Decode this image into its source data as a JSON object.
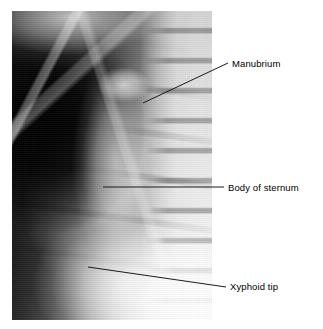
{
  "figure": {
    "type": "annotated-radiograph",
    "modality": "X-ray",
    "view": "lateral sternum",
    "background_color": "#ffffff",
    "line_color": "#1a1a1a",
    "text_color": "#000000"
  },
  "image": {
    "alt_name": "lateral-chest-xray-sternum",
    "left": 12,
    "top": 11,
    "width": 200,
    "height": 309
  },
  "annotations": [
    {
      "id": "manubrium",
      "label": "Manubrium",
      "leader": {
        "x1": 143,
        "y1": 103,
        "x2": 228,
        "y2": 63
      },
      "label_x": 232,
      "label_y": 58
    },
    {
      "id": "body-of-sternum",
      "label": "Body of sternum",
      "leader": {
        "x1": 103,
        "y1": 187,
        "x2": 224,
        "y2": 187
      },
      "label_x": 228,
      "label_y": 182
    },
    {
      "id": "xyphoid-tip",
      "label": "Xyphoid tip",
      "leader": {
        "x1": 88,
        "y1": 267,
        "x2": 226,
        "y2": 287
      },
      "label_x": 230,
      "label_y": 281
    }
  ]
}
